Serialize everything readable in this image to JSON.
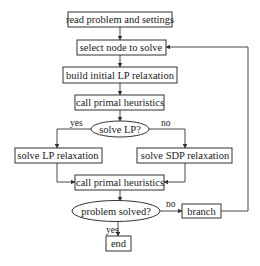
{
  "flowchart": {
    "nodes": [
      {
        "id": "read",
        "shape": "rect",
        "label": "read problem and settings"
      },
      {
        "id": "select",
        "shape": "rect",
        "label": "select node to solve"
      },
      {
        "id": "build",
        "shape": "rect",
        "label": "build initial LP relaxation"
      },
      {
        "id": "heur1",
        "shape": "rect",
        "label": "call primal heuristics"
      },
      {
        "id": "decide_lp",
        "shape": "ellipse",
        "label": "solve LP?"
      },
      {
        "id": "solve_lp",
        "shape": "rect",
        "label": "solve LP relaxation"
      },
      {
        "id": "solve_sdp",
        "shape": "rect",
        "label": "solve SDP relaxation"
      },
      {
        "id": "heur2",
        "shape": "rect",
        "label": "call primal heuristics"
      },
      {
        "id": "decide_solved",
        "shape": "ellipse",
        "label": "problem solved?"
      },
      {
        "id": "branch",
        "shape": "rect",
        "label": "branch"
      },
      {
        "id": "end",
        "shape": "rect",
        "label": "end"
      }
    ],
    "edge_labels": {
      "lp_yes": "yes",
      "lp_no": "no",
      "solved_no": "no",
      "solved_yes": "yes"
    },
    "edges": [
      {
        "from": "read",
        "to": "select"
      },
      {
        "from": "select",
        "to": "build"
      },
      {
        "from": "build",
        "to": "heur1"
      },
      {
        "from": "heur1",
        "to": "decide_lp"
      },
      {
        "from": "decide_lp",
        "to": "solve_lp",
        "label": "yes"
      },
      {
        "from": "decide_lp",
        "to": "solve_sdp",
        "label": "no"
      },
      {
        "from": "solve_lp",
        "to": "heur2"
      },
      {
        "from": "solve_sdp",
        "to": "heur2"
      },
      {
        "from": "heur2",
        "to": "decide_solved"
      },
      {
        "from": "decide_solved",
        "to": "branch",
        "label": "no"
      },
      {
        "from": "decide_solved",
        "to": "end",
        "label": "yes"
      },
      {
        "from": "branch",
        "to": "select"
      }
    ]
  }
}
